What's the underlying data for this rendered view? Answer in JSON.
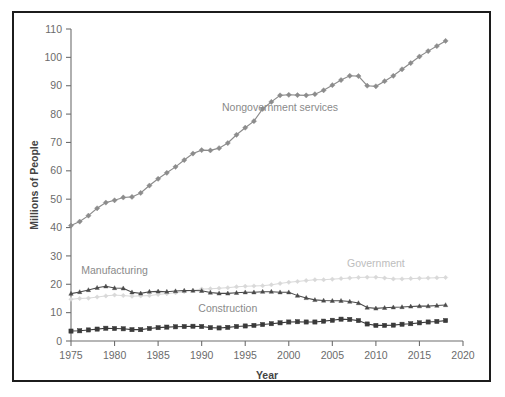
{
  "chart_data": {
    "type": "line",
    "title": "",
    "xlabel": "Year",
    "ylabel": "Millions of People",
    "xlim": [
      1975,
      2020
    ],
    "ylim": [
      0,
      110
    ],
    "xticks": [
      1975,
      1980,
      1985,
      1990,
      1995,
      2000,
      2005,
      2010,
      2015,
      2020
    ],
    "yticks": [
      0,
      10,
      20,
      30,
      40,
      50,
      60,
      70,
      80,
      90,
      100,
      110
    ],
    "grid": false,
    "legend_position": "inline-annotations",
    "x": [
      1975,
      1976,
      1977,
      1978,
      1979,
      1980,
      1981,
      1982,
      1983,
      1984,
      1985,
      1986,
      1987,
      1988,
      1989,
      1990,
      1991,
      1992,
      1993,
      1994,
      1995,
      1996,
      1997,
      1998,
      1999,
      2000,
      2001,
      2002,
      2003,
      2004,
      2005,
      2006,
      2007,
      2008,
      2009,
      2010,
      2011,
      2012,
      2013,
      2014,
      2015,
      2016,
      2017,
      2018
    ],
    "series": [
      {
        "name": "Nongovernment services",
        "color": "#8c8c8c",
        "marker": "diamond",
        "label_x": 1999,
        "label_y": 81,
        "values": [
          40.7,
          42.1,
          44.2,
          46.8,
          48.8,
          49.6,
          50.6,
          50.8,
          52.2,
          54.8,
          57.2,
          59.3,
          61.4,
          63.8,
          66.1,
          67.3,
          67.2,
          68.0,
          69.8,
          72.7,
          75.2,
          77.5,
          81.8,
          84.3,
          86.6,
          86.8,
          86.7,
          86.6,
          87.0,
          88.4,
          90.2,
          92.0,
          93.5,
          93.4,
          90.0,
          89.8,
          91.6,
          93.5,
          95.8,
          98.0,
          100.3,
          102.2,
          104.0,
          105.8
        ]
      },
      {
        "name": "Manufacturing",
        "color": "#4a4a4a",
        "marker": "triangle",
        "label_x": 1980,
        "label_y": 23.5,
        "values": [
          16.7,
          17.3,
          18.0,
          18.8,
          19.3,
          18.7,
          18.6,
          17.2,
          16.8,
          17.4,
          17.5,
          17.4,
          17.6,
          17.8,
          17.8,
          17.7,
          17.1,
          16.8,
          16.8,
          17.0,
          17.2,
          17.2,
          17.4,
          17.4,
          17.2,
          17.2,
          16.0,
          15.2,
          14.5,
          14.3,
          14.2,
          14.2,
          13.9,
          13.4,
          11.8,
          11.5,
          11.7,
          11.9,
          12.0,
          12.2,
          12.3,
          12.3,
          12.5,
          12.7
        ]
      },
      {
        "name": "Construction",
        "color": "#3a3a3a",
        "marker": "square",
        "label_x": 1993,
        "label_y": 10.2,
        "values": [
          3.5,
          3.6,
          3.9,
          4.2,
          4.5,
          4.4,
          4.3,
          4.0,
          4.0,
          4.4,
          4.7,
          4.9,
          5.0,
          5.1,
          5.2,
          5.1,
          4.7,
          4.6,
          4.8,
          5.1,
          5.3,
          5.5,
          5.8,
          6.1,
          6.4,
          6.7,
          6.8,
          6.7,
          6.7,
          7.0,
          7.3,
          7.7,
          7.6,
          7.2,
          6.0,
          5.5,
          5.5,
          5.6,
          5.9,
          6.1,
          6.4,
          6.7,
          6.9,
          7.2
        ]
      },
      {
        "name": "Government",
        "color": "#d9d9d9",
        "marker": "diamond",
        "label_x": 2010,
        "label_y": 26.0,
        "values": [
          14.7,
          15.0,
          15.1,
          15.5,
          15.9,
          16.2,
          16.0,
          15.8,
          15.9,
          16.0,
          16.4,
          16.7,
          17.0,
          17.4,
          17.8,
          18.3,
          18.4,
          18.6,
          18.8,
          19.1,
          19.3,
          19.4,
          19.5,
          19.8,
          20.3,
          20.7,
          21.0,
          21.3,
          21.6,
          21.6,
          21.8,
          22.0,
          22.2,
          22.4,
          22.5,
          22.5,
          22.2,
          21.9,
          21.9,
          22.0,
          22.1,
          22.2,
          22.3,
          22.4
        ]
      }
    ]
  },
  "axis": {
    "y_title": "Millions of People",
    "x_title": "Year",
    "x_tick_labels": [
      "1975",
      "1980",
      "1985",
      "1990",
      "1995",
      "2000",
      "2005",
      "2010",
      "2015",
      "2020"
    ],
    "y_tick_labels": [
      "0",
      "10",
      "20",
      "30",
      "40",
      "50",
      "60",
      "70",
      "80",
      "90",
      "100",
      "110"
    ]
  },
  "annotations": {
    "nongovernment_services": "Nongovernment services",
    "manufacturing": "Manufacturing",
    "construction": "Construction",
    "government": "Government"
  },
  "colors": {
    "frame": "#1c1c1c",
    "background": "#ffffff",
    "axis": "#6e6e6e",
    "tick_text": "#6b6b6b",
    "nongovernment_services": "#8c8c8c",
    "manufacturing": "#4a4a4a",
    "construction": "#3a3a3a",
    "government": "#d9d9d9"
  }
}
